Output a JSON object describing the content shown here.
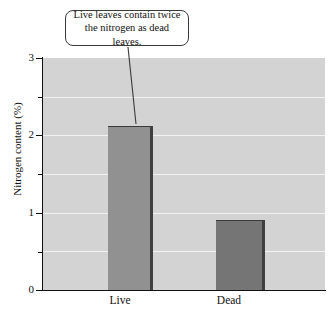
{
  "chart_data": {
    "type": "bar",
    "title": "",
    "xlabel": "",
    "ylabel": "Nitrogen content (%)",
    "categories": [
      "Live",
      "Dead"
    ],
    "values": [
      2.12,
      0.9
    ],
    "ylim": [
      0,
      3
    ],
    "yticks": [
      0,
      1,
      2,
      3
    ],
    "ytick_labels": [
      "0",
      "1",
      "2",
      "3"
    ],
    "yminor_ticks": [
      0.5,
      1.5,
      2.5
    ],
    "grid": true,
    "gridlines": [
      0.5,
      1.0,
      1.5,
      2.0,
      2.5
    ],
    "legend": null,
    "annotations": [
      {
        "text": "Live leaves contain twice the nitrogen as dead leaves.",
        "line1": "Live leaves contain twice",
        "line2": "the nitrogen as dead leaves.",
        "points_to": "Live"
      }
    ],
    "colors": {
      "plot_background": "#d3d3d3",
      "gridline": "#f2f2f2",
      "bar_live": "#919191",
      "bar_dead": "#757575",
      "bar_shadow": "#3f3f3f",
      "axis": "#111111",
      "text": "#111111",
      "callout_background": "#ffffff",
      "callout_border": "#3a3a3a"
    }
  },
  "axis": {
    "y_title": "Nitrogen content (%)",
    "tick_labels": {
      "t3": "3",
      "t2": "2",
      "t1": "1",
      "t0": "0"
    },
    "x_labels": {
      "live": "Live",
      "dead": "Dead"
    }
  },
  "callout": {
    "line1": "Live leaves contain twice",
    "line2": "the nitrogen as dead leaves."
  }
}
